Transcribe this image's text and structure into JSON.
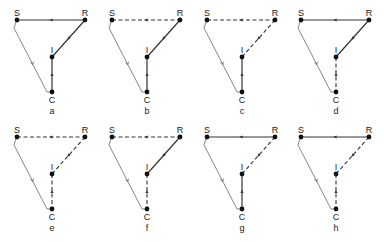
{
  "figure": {
    "node_labels": {
      "S": "S",
      "R": "R",
      "I": "I",
      "C": "C"
    },
    "colors": {
      "line": "#333333",
      "node": "#111111",
      "text": "#222222"
    },
    "panel_width": 95,
    "rows": [
      {
        "y_offset": 0
      },
      {
        "y_offset": 117
      }
    ],
    "panels": [
      {
        "id": "a",
        "label": "a",
        "col": 0,
        "row": 0,
        "edges": {
          "SR": "solid",
          "RI": "solid",
          "IC": "solid"
        }
      },
      {
        "id": "b",
        "label": "b",
        "col": 1,
        "row": 0,
        "edges": {
          "SR": "dashed",
          "RI": "solid",
          "IC": "solid"
        }
      },
      {
        "id": "c",
        "label": "c",
        "col": 2,
        "row": 0,
        "edges": {
          "SR": "dashed",
          "RI": "dashed",
          "IC": "solid"
        }
      },
      {
        "id": "d",
        "label": "d",
        "col": 3,
        "row": 0,
        "edges": {
          "SR": "solid",
          "RI": "solid",
          "IC": "dashed"
        }
      },
      {
        "id": "e",
        "label": "e",
        "col": 0,
        "row": 1,
        "edges": {
          "SR": "dashed",
          "RI": "dashed",
          "IC": "dashed"
        }
      },
      {
        "id": "f",
        "label": "f",
        "col": 1,
        "row": 1,
        "edges": {
          "SR": "dashed",
          "RI": "solid",
          "IC": "dashed"
        }
      },
      {
        "id": "g",
        "label": "g",
        "col": 2,
        "row": 1,
        "edges": {
          "SR": "solid",
          "RI": "dashed",
          "IC": "solid"
        }
      },
      {
        "id": "h",
        "label": "h",
        "col": 3,
        "row": 1,
        "edges": {
          "SR": "solid",
          "RI": "dashed",
          "IC": "dashed"
        }
      }
    ]
  }
}
